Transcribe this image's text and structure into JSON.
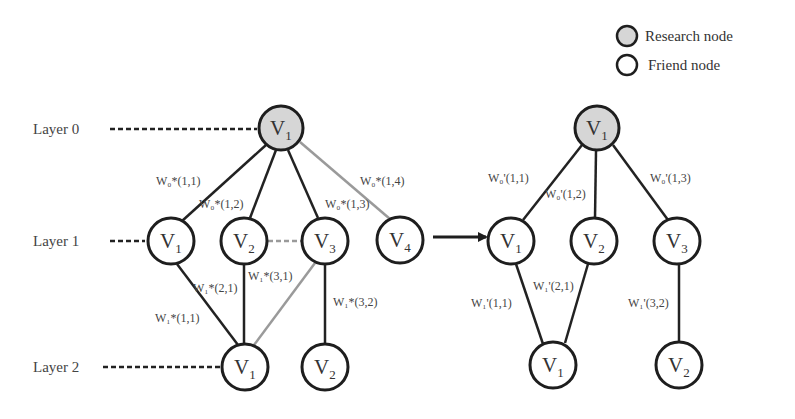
{
  "legend": {
    "research_label": "Research node",
    "friend_label": "Friend node"
  },
  "colors": {
    "edge_dark": "#222222",
    "edge_gray": "#9a9a9a",
    "research_fill": "#d6d6d6",
    "friend_fill": "#ffffff",
    "stroke": "#1e1e1e"
  },
  "layers": [
    "Layer 0",
    "Layer 1",
    "Layer 2"
  ],
  "left_graph": {
    "nodes": {
      "l0_v1": {
        "base": "V",
        "sub": "1",
        "type": "research"
      },
      "l1_v1": {
        "base": "V",
        "sub": "1",
        "type": "friend"
      },
      "l1_v2": {
        "base": "V",
        "sub": "2",
        "type": "friend"
      },
      "l1_v3": {
        "base": "V",
        "sub": "3",
        "type": "friend"
      },
      "l1_v4": {
        "base": "V",
        "sub": "4",
        "type": "friend"
      },
      "l2_v1": {
        "base": "V",
        "sub": "1",
        "type": "friend"
      },
      "l2_v2": {
        "base": "V",
        "sub": "2",
        "type": "friend"
      }
    },
    "weights": {
      "w0_11": "W₀*(1,1)",
      "w0_12": "W₀*(1,2)",
      "w0_13": "W₀*(1,3)",
      "w0_14": "W₀*(1,4)",
      "w1_11": "W₁*(1,1)",
      "w1_21": "W₁*(2,1)",
      "w1_31": "W₁*(3,1)",
      "w1_32": "W₁*(3,2)"
    }
  },
  "right_graph": {
    "nodes": {
      "l0_v1": {
        "base": "V",
        "sub": "1",
        "type": "research"
      },
      "l1_v1": {
        "base": "V",
        "sub": "1",
        "type": "friend"
      },
      "l1_v2": {
        "base": "V",
        "sub": "2",
        "type": "friend"
      },
      "l1_v3": {
        "base": "V",
        "sub": "3",
        "type": "friend"
      },
      "l2_v1": {
        "base": "V",
        "sub": "1",
        "type": "friend"
      },
      "l2_v2": {
        "base": "V",
        "sub": "2",
        "type": "friend"
      }
    },
    "weights": {
      "w0_11": "W₀'(1,1)",
      "w0_12": "W₀'(1,2)",
      "w0_13": "W₀'(1,3)",
      "w1_11": "W₁'(1,1)",
      "w1_21": "W₁'(2,1)",
      "w1_32": "W₁'(3,2)"
    }
  }
}
